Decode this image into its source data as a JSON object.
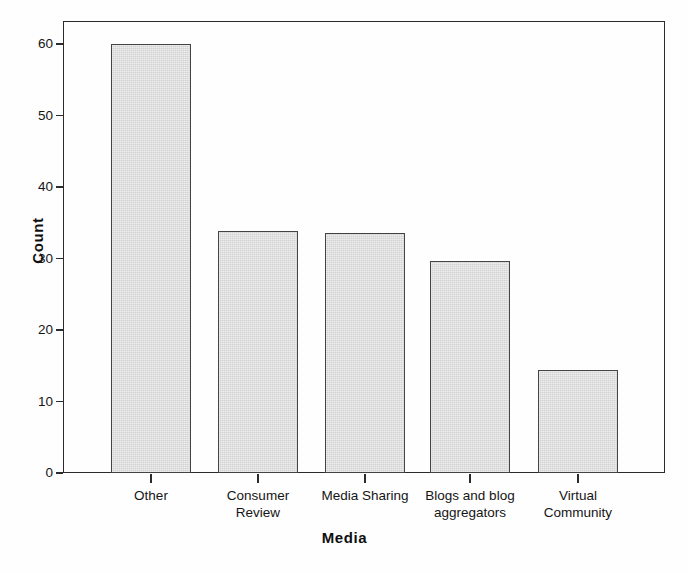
{
  "chart_data": {
    "type": "bar",
    "title": "",
    "xlabel": "Media",
    "ylabel": "Count",
    "categories": [
      "Other",
      "Consumer\nReview",
      "Media Sharing",
      "Blogs and blog\naggregators",
      "Virtual\nCommunity"
    ],
    "values": [
      60,
      33.8,
      33.6,
      29.6,
      14.4
    ],
    "ylim": [
      0,
      63
    ],
    "yticks": [
      0,
      10,
      20,
      30,
      40,
      50,
      60
    ],
    "ytick_labels": [
      "0",
      "10",
      "20",
      "30",
      "40",
      "50",
      "60"
    ],
    "grid": false,
    "legend": null,
    "bar_fill_color": "#d2d2d2",
    "bar_edge_color": "#444444",
    "axis_color": "#2b2b2b",
    "background_color": "#ffffff"
  },
  "axes": {
    "y_title": "Count",
    "x_title": "Media"
  },
  "bars": [
    {
      "label": "Other",
      "value": 60,
      "value_text": "60"
    },
    {
      "label": "Consumer\nReview",
      "value": 33.8,
      "value_text": "33.8"
    },
    {
      "label": "Media Sharing",
      "value": 33.6,
      "value_text": "33.6"
    },
    {
      "label": "Blogs and blog\naggregators",
      "value": 29.6,
      "value_text": "29.6"
    },
    {
      "label": "Virtual\nCommunity",
      "value": 14.4,
      "value_text": "14.4"
    }
  ],
  "yticks": [
    {
      "label": "60",
      "value": 60
    },
    {
      "label": "50",
      "value": 50
    },
    {
      "label": "40",
      "value": 40
    },
    {
      "label": "30",
      "value": 30
    },
    {
      "label": "20",
      "value": 20
    },
    {
      "label": "10",
      "value": 10
    },
    {
      "label": "0",
      "value": 0
    }
  ]
}
